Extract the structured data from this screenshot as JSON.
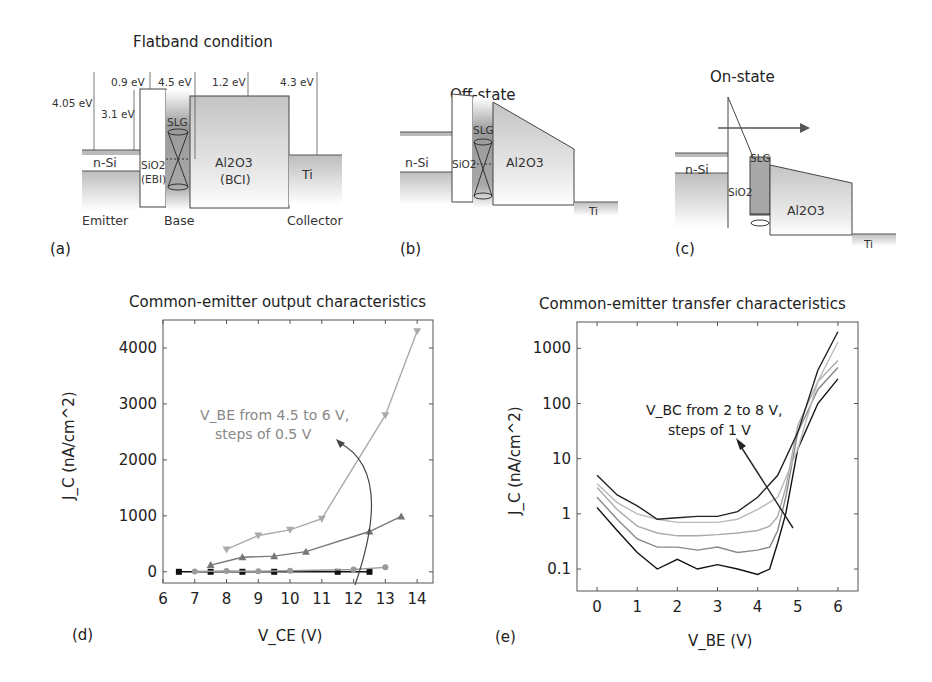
{
  "panels": {
    "a": {
      "label": "(a)",
      "title": "Flatband condition",
      "energies": {
        "e1": "4.05 eV",
        "e2": "3.1 eV",
        "e3": "0.9 eV",
        "e4": "4.5 eV",
        "e5": "1.2 eV",
        "e6": "4.3 eV"
      },
      "materials": {
        "nsi": "n-Si",
        "sio2": "SiO2",
        "ebi": "(EBI)",
        "slg": "SLG",
        "al2o3": "Al2O3",
        "bci": "(BCI)",
        "ti": "Ti"
      },
      "regions": {
        "emitter": "Emitter",
        "base": "Base",
        "collector": "Collector"
      }
    },
    "b": {
      "label": "(b)",
      "title": "Off-state",
      "materials": {
        "nsi": "n-Si",
        "sio2": "SiO2",
        "slg": "SLG",
        "al2o3": "Al2O3",
        "ti": "Ti"
      }
    },
    "c": {
      "label": "(c)",
      "title": "On-state",
      "materials": {
        "nsi": "n-Si",
        "sio2": "SiO2",
        "slg": "SLG",
        "al2o3": "Al2O3",
        "ti": "Ti"
      }
    },
    "d": {
      "label": "(d)"
    },
    "e": {
      "label": "(e)"
    }
  },
  "chart_data": [
    {
      "type": "line",
      "title": "Common-emitter output characteristics",
      "xlabel": "V_CE (V)",
      "ylabel": "J_C (nA/cm^2)",
      "xlim": [
        6,
        14.5
      ],
      "ylim": [
        -200,
        4500
      ],
      "xticks": [
        "6",
        "7",
        "8",
        "9",
        "10",
        "11",
        "12",
        "13",
        "14"
      ],
      "yticks": [
        "0",
        "1000",
        "2000",
        "3000",
        "4000"
      ],
      "annotation": {
        "line1": "V_BE from 4.5 to 6 V,",
        "line2": "steps of 0.5 V"
      },
      "series": [
        {
          "name": "V_BE = 4.5 V",
          "marker": "square",
          "color": "#111111",
          "x": [
            6.5,
            7.5,
            8.5,
            9.5,
            11.5,
            12.5
          ],
          "y": [
            0,
            0,
            0,
            0,
            0,
            0
          ]
        },
        {
          "name": "V_BE = 5.0 V",
          "marker": "circle",
          "color": "#999999",
          "x": [
            7,
            8,
            9,
            10,
            12,
            13
          ],
          "y": [
            5,
            15,
            10,
            20,
            40,
            80
          ]
        },
        {
          "name": "V_BE = 5.5 V",
          "marker": "triangle-up",
          "color": "#777777",
          "x": [
            7.5,
            8.5,
            9.5,
            10.5,
            12.5,
            13.5
          ],
          "y": [
            120,
            260,
            280,
            360,
            720,
            990
          ]
        },
        {
          "name": "V_BE = 6.0 V",
          "marker": "triangle-down",
          "color": "#aaaaaa",
          "x": [
            8,
            9,
            10,
            11,
            13,
            14
          ],
          "y": [
            400,
            650,
            750,
            950,
            2800,
            4300
          ]
        }
      ]
    },
    {
      "type": "line",
      "title": "Common-emitter transfer characteristics",
      "xlabel": "V_BE (V)",
      "ylabel": "J_C (nA/cm^2)",
      "yscale": "log",
      "xlim": [
        -0.5,
        6.5
      ],
      "ylim": [
        0.04,
        3000
      ],
      "xticks": [
        "0",
        "1",
        "2",
        "3",
        "4",
        "5",
        "6"
      ],
      "yticks": [
        "0.1",
        "1",
        "10",
        "100",
        "1000"
      ],
      "annotation": {
        "line1": "V_BC from 2 to 8 V,",
        "line2": "steps of 1 V"
      },
      "series": [
        {
          "name": "V_BC = 2 V",
          "color": "#111111",
          "x": [
            0,
            0.5,
            1,
            1.5,
            2,
            2.5,
            3,
            3.5,
            4,
            4.3,
            4.5,
            4.7,
            5,
            5.5,
            6
          ],
          "y": [
            1.3,
            0.5,
            0.2,
            0.1,
            0.15,
            0.1,
            0.12,
            0.1,
            0.08,
            0.1,
            0.3,
            1,
            15,
            100,
            280
          ]
        },
        {
          "name": "V_BC = 4 V",
          "color": "#888888",
          "x": [
            0,
            0.5,
            1,
            1.5,
            2,
            2.5,
            3,
            3.5,
            4,
            4.3,
            4.5,
            4.7,
            5,
            5.5,
            6
          ],
          "y": [
            2,
            0.8,
            0.35,
            0.25,
            0.25,
            0.22,
            0.25,
            0.2,
            0.22,
            0.25,
            0.5,
            2,
            30,
            180,
            450
          ]
        },
        {
          "name": "V_BC = 6 V",
          "color": "#aaaaaa",
          "x": [
            0,
            0.5,
            1,
            1.5,
            2,
            2.5,
            3,
            3.5,
            4,
            4.3,
            4.5,
            4.7,
            5,
            5.5,
            6
          ],
          "y": [
            3,
            1.2,
            0.6,
            0.45,
            0.4,
            0.4,
            0.42,
            0.45,
            0.5,
            0.6,
            0.9,
            3,
            40,
            250,
            600
          ]
        },
        {
          "name": "V_BC = 7 V",
          "color": "#bbbbbb",
          "x": [
            0,
            0.5,
            1,
            1.5,
            2,
            2.5,
            3,
            3.5,
            4,
            4.5,
            5,
            5.5,
            6
          ],
          "y": [
            3.5,
            1.6,
            1.0,
            0.8,
            0.7,
            0.7,
            0.7,
            0.8,
            1.2,
            2,
            15,
            250,
            1300
          ]
        },
        {
          "name": "V_BC = 8 V",
          "color": "#222222",
          "x": [
            0,
            0.5,
            1,
            1.5,
            2,
            2.5,
            3,
            3.5,
            4,
            4.5,
            5,
            5.5,
            6
          ],
          "y": [
            5,
            2.2,
            1.4,
            0.8,
            0.85,
            0.9,
            0.9,
            1.1,
            2,
            5,
            30,
            400,
            2000
          ]
        }
      ]
    }
  ]
}
